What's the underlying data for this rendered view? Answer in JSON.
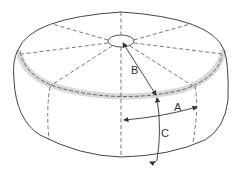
{
  "diagram": {
    "colors": {
      "outline": "#444444",
      "dashed": "#555555",
      "seam_shade": "#bdbdbd",
      "background": "#ffffff"
    },
    "labels": {
      "a": "A",
      "b": "B",
      "c": "C"
    },
    "measurements": [
      {
        "id": "A",
        "description": "Horizontal arc across side panel (width of one panel)"
      },
      {
        "id": "B",
        "description": "Radius from center hub to top seam"
      },
      {
        "id": "C",
        "description": "Vertical height along side from top seam to bottom"
      }
    ],
    "panels_top": 8
  }
}
